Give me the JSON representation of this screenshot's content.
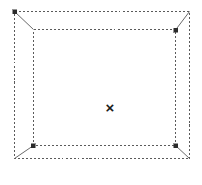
{
  "canvas": {
    "width": 202,
    "height": 185,
    "background": "#ffffff"
  },
  "diagram": {
    "stroke_color": "#5a5a5a",
    "handle_color": "#2b2b2b",
    "dash_pattern": "2 2",
    "outer_rect": {
      "name": "outer-frame",
      "x": 14,
      "y": 11,
      "width": 176,
      "height": 148,
      "style": "dashed"
    },
    "inner_rect": {
      "name": "inner-frame",
      "x": 33,
      "y": 29,
      "width": 143,
      "height": 117,
      "style": "dashed"
    },
    "corner_connectors": [
      {
        "name": "connector-top-left",
        "x1": 14,
        "y1": 11,
        "x2": 33,
        "y2": 29
      },
      {
        "name": "connector-top-right",
        "x1": 190,
        "y1": 11,
        "x2": 176,
        "y2": 30
      },
      {
        "name": "connector-bottom-left",
        "x1": 14,
        "y1": 159,
        "x2": 33,
        "y2": 146
      },
      {
        "name": "connector-bottom-right",
        "x1": 190,
        "y1": 159,
        "x2": 176,
        "y2": 146
      }
    ],
    "handles": [
      {
        "name": "handle-outer-top-left",
        "x": 14,
        "y": 11,
        "size": 4
      },
      {
        "name": "handle-inner-top-right",
        "x": 176,
        "y": 30,
        "size": 4
      },
      {
        "name": "handle-inner-bottom-left",
        "x": 33,
        "y": 146,
        "size": 4
      },
      {
        "name": "handle-inner-bottom-right",
        "x": 176,
        "y": 146,
        "size": 4
      }
    ],
    "center_marker": {
      "name": "center-cross-marker",
      "glyph": "×",
      "x": 110,
      "y": 107
    }
  }
}
